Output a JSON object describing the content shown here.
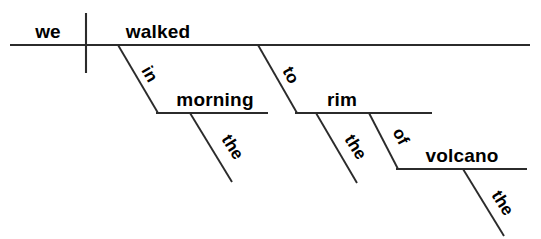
{
  "diagram": {
    "type": "reed-kellogg-sentence-diagram",
    "sentence": "We walked in the morning to the rim of the volcano.",
    "canvas": {
      "width": 541,
      "height": 239,
      "background": "#ffffff"
    },
    "ink_color": "#2b2b2b",
    "text_color": "#000000",
    "words": {
      "subject": "we",
      "verb": "walked",
      "prep1": "in",
      "prep1_object": "morning",
      "prep1_article": "the",
      "prep2": "to",
      "prep2_object": "rim",
      "prep2_article": "the",
      "prep3": "of",
      "prep3_object": "volcano",
      "prep3_article": "the"
    },
    "labels": {
      "subject_role": "subject",
      "verb_role": "verb",
      "prep1_role": "preposition",
      "prep1_object_role": "object-of-preposition",
      "prep2_role": "preposition",
      "prep2_object_role": "object-of-preposition",
      "prep3_role": "preposition",
      "prep3_object_role": "object-of-preposition"
    },
    "lines": {
      "baseline": {
        "x1": 10,
        "y1": 45,
        "x2": 530,
        "y2": 45
      },
      "subject_divider": {
        "x1": 86,
        "y1": 13,
        "x2": 86,
        "y2": 73
      },
      "prep1_slant": {
        "x1": 118,
        "y1": 45,
        "x2": 158,
        "y2": 113
      },
      "prep1_obj_line": {
        "x1": 156,
        "y1": 113,
        "x2": 268,
        "y2": 113
      },
      "prep1_art_slant": {
        "x1": 190,
        "y1": 113,
        "x2": 232,
        "y2": 182
      },
      "prep2_slant": {
        "x1": 258,
        "y1": 45,
        "x2": 297,
        "y2": 113
      },
      "prep2_obj_line": {
        "x1": 295,
        "y1": 113,
        "x2": 432,
        "y2": 113
      },
      "prep2_art_slant": {
        "x1": 316,
        "y1": 113,
        "x2": 357,
        "y2": 183
      },
      "prep3_slant": {
        "x1": 369,
        "y1": 113,
        "x2": 398,
        "y2": 169
      },
      "prep3_obj_line": {
        "x1": 396,
        "y1": 169,
        "x2": 527,
        "y2": 169
      },
      "prep3_art_slant": {
        "x1": 463,
        "y1": 169,
        "x2": 504,
        "y2": 236
      }
    },
    "text_positions": {
      "subject": {
        "x": 48,
        "y": 38,
        "rotate": 0,
        "anchor": "middle"
      },
      "verb": {
        "x": 158,
        "y": 38,
        "rotate": 0,
        "anchor": "middle"
      },
      "prep1": {
        "x": 145,
        "y": 77,
        "rotate": 60,
        "anchor": "middle"
      },
      "prep1_object": {
        "x": 215,
        "y": 106,
        "rotate": 0,
        "anchor": "middle"
      },
      "prep1_article": {
        "x": 228,
        "y": 150,
        "rotate": 58,
        "anchor": "middle"
      },
      "prep2": {
        "x": 286,
        "y": 78,
        "rotate": 60,
        "anchor": "middle"
      },
      "prep2_object": {
        "x": 342,
        "y": 106,
        "rotate": 0,
        "anchor": "middle"
      },
      "prep2_article": {
        "x": 351,
        "y": 150,
        "rotate": 58,
        "anchor": "middle"
      },
      "prep3": {
        "x": 396,
        "y": 139,
        "rotate": 62,
        "anchor": "middle"
      },
      "prep3_object": {
        "x": 462,
        "y": 162,
        "rotate": 0,
        "anchor": "middle"
      },
      "prep3_article": {
        "x": 498,
        "y": 206,
        "rotate": 58,
        "anchor": "middle"
      }
    }
  }
}
